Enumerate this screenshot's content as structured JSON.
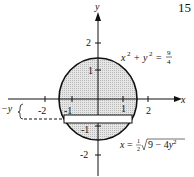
{
  "problem_number": "15",
  "axes": {
    "x_label": "x",
    "y_label": "y",
    "x_ticks": [
      "-2",
      "-1",
      "1",
      "2"
    ],
    "y_ticks": [
      "2",
      "1",
      "-1",
      "-2"
    ]
  },
  "equations": {
    "circle": "x² + y² = 9/4",
    "circle_lhs": "x",
    "circle_rhs_num": "9",
    "circle_rhs_den": "4",
    "strip": "x = ½√(9 − 4y²)"
  },
  "strip_label": "−y",
  "colors": {
    "fill": "#d8d8d8",
    "stroke": "#111111"
  }
}
